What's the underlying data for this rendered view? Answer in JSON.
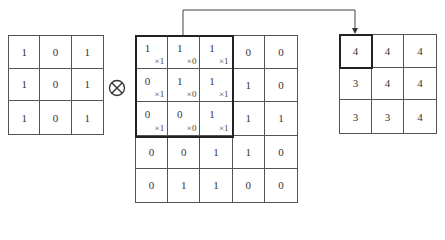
{
  "kernel": {
    "rows": [
      [
        "1",
        "0",
        "1"
      ],
      [
        "1",
        "0",
        "1"
      ],
      [
        "1",
        "0",
        "1"
      ]
    ]
  },
  "operator": {
    "symbol": "⊗",
    "icon": "circled-times-icon"
  },
  "input": {
    "rows": [
      [
        "1",
        "1",
        "1",
        "0",
        "0"
      ],
      [
        "0",
        "1",
        "1",
        "1",
        "0"
      ],
      [
        "0",
        "0",
        "1",
        "1",
        "1"
      ],
      [
        "0",
        "0",
        "1",
        "1",
        "0"
      ],
      [
        "0",
        "1",
        "1",
        "0",
        "0"
      ]
    ],
    "window_weights": [
      [
        "×1",
        "×0",
        "×1"
      ],
      [
        "×1",
        "×0",
        "×1"
      ],
      [
        "×1",
        "×0",
        "×1"
      ]
    ]
  },
  "output": {
    "rows": [
      [
        "4",
        "4",
        "4"
      ],
      [
        "3",
        "4",
        "4"
      ],
      [
        "3",
        "3",
        "4"
      ]
    ]
  },
  "colors": {
    "line": "#555555",
    "highlight": "#222222",
    "text": "#333333"
  }
}
